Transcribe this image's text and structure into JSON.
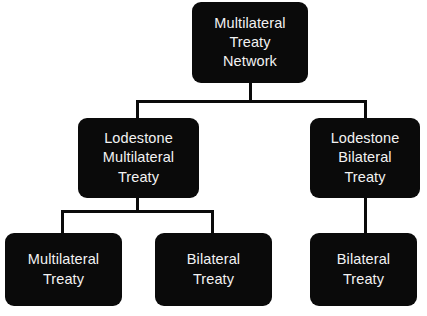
{
  "diagram": {
    "background_color": "#ffffff",
    "node_color": "#0a0a0a",
    "text_color": "#ffffff",
    "connector_color": "#0a0a0a",
    "nodes": [
      {
        "id": "root",
        "label": "Multilateral\nTreaty\nNetwork",
        "level": 0
      },
      {
        "id": "lodestone-multilateral",
        "label": "Lodestone\nMultilateral\nTreaty",
        "level": 1
      },
      {
        "id": "lodestone-bilateral",
        "label": "Lodestone\nBilateral\nTreaty",
        "level": 1
      },
      {
        "id": "multilateral-treaty",
        "label": "Multilateral\nTreaty",
        "level": 2
      },
      {
        "id": "bilateral-treaty-left",
        "label": "Bilateral\nTreaty",
        "level": 2
      },
      {
        "id": "bilateral-treaty-right",
        "label": "Bilateral\nTreaty",
        "level": 2
      }
    ],
    "edges": [
      {
        "from": "root",
        "to": "lodestone-multilateral"
      },
      {
        "from": "root",
        "to": "lodestone-bilateral"
      },
      {
        "from": "lodestone-multilateral",
        "to": "multilateral-treaty"
      },
      {
        "from": "lodestone-multilateral",
        "to": "bilateral-treaty-left"
      },
      {
        "from": "lodestone-bilateral",
        "to": "bilateral-treaty-right"
      }
    ]
  }
}
